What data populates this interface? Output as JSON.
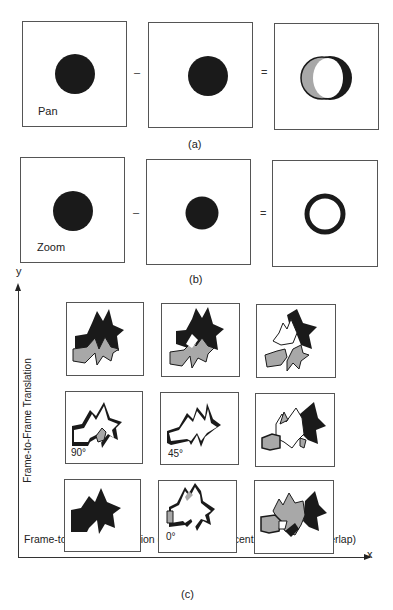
{
  "panel_a": {
    "caption": "(a)",
    "frame1_label": "Pan",
    "minus_op": "–",
    "equals_op": "="
  },
  "panel_b": {
    "caption": "(b)",
    "frame1_label": "Zoom",
    "minus_op": "–",
    "equals_op": "="
  },
  "panel_c": {
    "caption": "(c)",
    "y_axis_letter": "y",
    "x_axis_letter": "x",
    "y_axis_label": "Frame-to-Frame Translation",
    "x_axis_label": "Frame-to-Frame Translation (Black = Most recent and White = Overlap)",
    "angle_labels": {
      "row2_col1": "90°",
      "row2_col2": "45°",
      "row3_col2": "0°"
    }
  },
  "colors": {
    "ink": "#1a1a1a",
    "gray_fill": "#a8a8a8",
    "frame_border": "#555555"
  }
}
